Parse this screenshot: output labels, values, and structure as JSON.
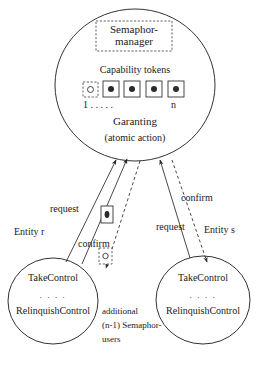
{
  "diagram": {
    "title_block": {
      "line1": "Semaphor-",
      "line2": "manager"
    },
    "manager_circle": {
      "tokens_label": "Capability tokens",
      "token_index_first": "1 . . . . .",
      "token_index_last": "n",
      "tokens": [
        {
          "state": "free",
          "style": "dashed",
          "dot": "hollow"
        },
        {
          "state": "held",
          "style": "solid",
          "dot": "filled"
        },
        {
          "state": "held",
          "style": "solid",
          "dot": "filled"
        },
        {
          "state": "held",
          "style": "solid",
          "dot": "filled"
        },
        {
          "state": "held",
          "style": "solid",
          "dot": "filled"
        }
      ],
      "action_line1": "Garanting",
      "action_line2": "(atomic action)"
    },
    "entities": [
      {
        "side": "left",
        "name": "Entity r",
        "op_top": "TakeControl",
        "op_dots": ". . . .",
        "op_bottom": "RelinquishControl"
      },
      {
        "side": "right",
        "name": "Entity s",
        "op_top": "TakeControl",
        "op_dots": ". . . .",
        "op_bottom": "RelinquishControl"
      }
    ],
    "edges": [
      {
        "id": "left-request",
        "label": "request",
        "style": "solid"
      },
      {
        "id": "left-confirm",
        "label": "confirm",
        "style": "dashed"
      },
      {
        "id": "right-confirm",
        "label": "confirm",
        "style": "dashed"
      },
      {
        "id": "right-request",
        "label": "request",
        "style": "solid"
      }
    ],
    "inflight_tokens": [
      {
        "id": "granted-token",
        "style": "solid",
        "dot": "filled"
      },
      {
        "id": "returned-token",
        "style": "dashed",
        "dot": "hollow"
      }
    ],
    "caption": {
      "line1": "additional",
      "line2": "(n-1) Semaphor-",
      "line3": "users"
    }
  },
  "colors": {
    "ink": "#1a1a1a",
    "line": "#333333",
    "background": "#ffffff"
  }
}
